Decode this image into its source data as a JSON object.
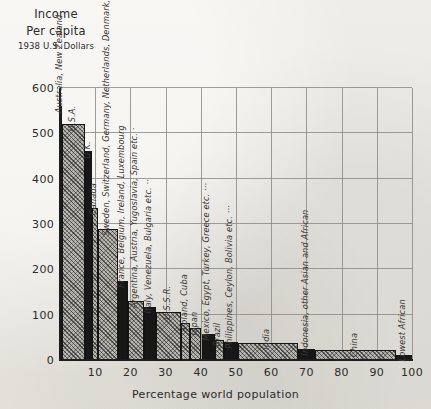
{
  "caption": {
    "line1": "Income",
    "line2": "Per capita",
    "line3": "1938 U.S. Dollars"
  },
  "axes": {
    "y_ticks": [
      "0",
      "100",
      "200",
      "300",
      "400",
      "500",
      "600"
    ],
    "x_ticks": [
      "10",
      "20",
      "30",
      "40",
      "50",
      "60",
      "70",
      "80",
      "90",
      "100"
    ],
    "x_axis_label": "Percentage world population"
  },
  "chart_data": {
    "type": "bar",
    "title": "Income Per capita 1938 U.S. Dollars",
    "subtitle": "",
    "xlabel": "Percentage world population",
    "ylabel": "Income Per capita 1938 U.S. Dollars",
    "xlim": [
      0,
      100
    ],
    "ylim": [
      0,
      600
    ],
    "grid": true,
    "legend": "none",
    "note": "Variable-width bars: width = share of world population, height = per capita income in 1938 U.S. Dollars. Fill alternates between solid black and cross-hatched grey.",
    "categories": [
      "Australia, New Zealand",
      "U.S.A.",
      "U.K.",
      "Canada",
      "Sweden, Switzerland, Germany, Netherlands, Denmark, Norway",
      "France, Belgium, Ireland, Luxembourg",
      "Argentina, Austria, Yugoslavia, Spain etc.",
      "Italy, Venezuela, Bulgaria etc.",
      "U.S.S.R.",
      "Poland, Cuba",
      "Japan",
      "Mexico, Egypt, Turkey, Greece etc.",
      "Brazil",
      "Philippines, Ceylon, Bolivia etc.",
      "India",
      "Indonesia, other Asian and African",
      "China",
      "Lowest African"
    ],
    "values": [
      560,
      520,
      460,
      335,
      290,
      175,
      130,
      118,
      105,
      82,
      70,
      58,
      45,
      40,
      38,
      25,
      22,
      12
    ],
    "x_start": [
      0.0,
      0.6,
      7.2,
      9.0,
      10.8,
      16.5,
      19.2,
      24.0,
      27.2,
      34.5,
      37.0,
      40.2,
      44.0,
      46.5,
      50.5,
      67.5,
      72.5,
      95.5
    ],
    "x_end": [
      0.6,
      7.2,
      9.0,
      10.8,
      16.5,
      19.2,
      24.0,
      27.2,
      34.5,
      37.0,
      40.2,
      44.0,
      46.5,
      50.5,
      67.5,
      72.5,
      95.5,
      100.0
    ],
    "fills": [
      "solid",
      "hatch",
      "solid",
      "hatch",
      "hatch",
      "solid",
      "hatch",
      "solid",
      "hatch",
      "hatch",
      "hatch",
      "solid",
      "hatch",
      "solid",
      "hatch",
      "solid",
      "hatch",
      "solid"
    ],
    "label_marks": [
      "",
      "",
      "",
      "",
      "",
      "",
      "·",
      "··",
      "",
      "",
      "",
      "···",
      "",
      "···",
      "",
      "",
      "",
      ""
    ]
  }
}
